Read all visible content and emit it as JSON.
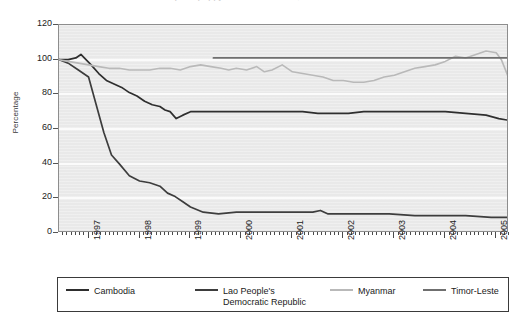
{
  "chart": {
    "title_cutoff": "Opium poppy cultivation trends, 1996-2005",
    "ylabel": "Percentage"
  },
  "yaxis": {
    "ticks": [
      "120",
      "100",
      "80",
      "60",
      "40",
      "20",
      "0"
    ]
  },
  "xaxis": {
    "ticks": [
      "1997",
      "1998",
      "1999",
      "2000",
      "2001",
      "2002",
      "2003",
      "2004",
      "2005"
    ]
  },
  "legend": {
    "items": [
      {
        "label": "Cambodia",
        "label2": "",
        "color": "#2e2e2e"
      },
      {
        "label": "Lao People's",
        "label2": "Democratic  Republic",
        "color": "#3d3d3d"
      },
      {
        "label": "Myanmar",
        "label2": "",
        "color": "#b9b9b9"
      },
      {
        "label": "Timor-Leste",
        "label2": "",
        "color": "#6f6f6f"
      }
    ]
  },
  "chart_data": {
    "type": "line",
    "title": "Opium poppy cultivation trends, 1996-2005",
    "xlabel": "",
    "ylabel": "Percentage",
    "xlim": [
      1996.42,
      2005.25
    ],
    "ylim": [
      0,
      120
    ],
    "ytick_step": 20,
    "grid": "horizontal",
    "legend_position": "bottom",
    "x_tick_labels": [
      "1997",
      "1998",
      "1999",
      "2000",
      "2001",
      "2002",
      "2003",
      "2004",
      "2005"
    ],
    "series": [
      {
        "name": "Cambodia",
        "color": "#2e2e2e",
        "x": [
          1996.42,
          1996.6,
          1996.75,
          1996.85,
          1996.95,
          1997.05,
          1997.2,
          1997.35,
          1997.5,
          1997.65,
          1997.8,
          1997.95,
          1998.1,
          1998.25,
          1998.4,
          1998.5,
          1998.6,
          1998.72,
          1998.85,
          1999.0,
          1999.2,
          1999.45,
          1999.7,
          2000.0,
          2000.3,
          2000.6,
          2000.9,
          2001.2,
          2001.5,
          2001.8,
          2002.1,
          2002.4,
          2002.8,
          2003.2,
          2003.6,
          2004.0,
          2004.4,
          2004.8,
          2005.05,
          2005.25
        ],
        "y": [
          100,
          100,
          101,
          103,
          100,
          97,
          92,
          88,
          86,
          84,
          81,
          79,
          76,
          74,
          73,
          71,
          70,
          66,
          68,
          70,
          70,
          70,
          70,
          70,
          70,
          70,
          70,
          70,
          69,
          69,
          69,
          70,
          70,
          70,
          70,
          70,
          69,
          68,
          66,
          65
        ]
      },
      {
        "name": "Lao People's Democratic Republic",
        "color": "#3d3d3d",
        "x": [
          1996.42,
          1996.6,
          1996.8,
          1997.0,
          1997.15,
          1997.3,
          1997.45,
          1997.6,
          1997.8,
          1998.0,
          1998.2,
          1998.4,
          1998.55,
          1998.7,
          1998.85,
          1999.0,
          1999.25,
          1999.55,
          1999.9,
          2000.3,
          2000.7,
          2001.1,
          2001.4,
          2001.55,
          2001.7,
          2002.0,
          2002.4,
          2002.9,
          2003.4,
          2003.9,
          2004.4,
          2004.9,
          2005.25
        ],
        "y": [
          100,
          98,
          94,
          90,
          74,
          58,
          45,
          40,
          33,
          30,
          29,
          27,
          23,
          21,
          18,
          15,
          12,
          11,
          12,
          12,
          12,
          12,
          12,
          13,
          11,
          11,
          11,
          11,
          10,
          10,
          10,
          9,
          9
        ]
      },
      {
        "name": "Myanmar",
        "color": "#b9b9b9",
        "x": [
          1996.42,
          1996.6,
          1996.8,
          1997.0,
          1997.2,
          1997.4,
          1997.6,
          1997.8,
          1998.0,
          1998.2,
          1998.4,
          1998.6,
          1998.8,
          1999.0,
          1999.2,
          1999.4,
          1999.6,
          1999.75,
          1999.9,
          2000.1,
          2000.3,
          2000.45,
          2000.6,
          2000.8,
          2001.0,
          2001.2,
          2001.4,
          2001.6,
          2001.8,
          2002.0,
          2002.2,
          2002.4,
          2002.6,
          2002.8,
          2003.0,
          2003.2,
          2003.4,
          2003.6,
          2003.8,
          2004.0,
          2004.2,
          2004.4,
          2004.6,
          2004.8,
          2005.0,
          2005.1,
          2005.25
        ],
        "y": [
          100,
          99,
          98,
          97,
          96,
          95,
          95,
          94,
          94,
          94,
          95,
          95,
          94,
          96,
          97,
          96,
          95,
          94,
          95,
          94,
          96,
          93,
          94,
          97,
          93,
          92,
          91,
          90,
          88,
          88,
          87,
          87,
          88,
          90,
          91,
          93,
          95,
          96,
          97,
          99,
          102,
          101,
          103,
          105,
          104,
          100,
          89
        ]
      },
      {
        "name": "Timor-Leste",
        "color": "#6f6f6f",
        "x": [
          1999.45,
          2000.0,
          2001.0,
          2002.0,
          2003.0,
          2004.0,
          2005.25
        ],
        "y": [
          101,
          101,
          101,
          101,
          101,
          101,
          101
        ]
      }
    ]
  }
}
